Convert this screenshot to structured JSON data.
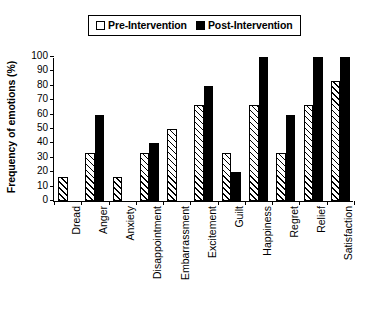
{
  "chart_data": {
    "type": "bar",
    "title": "",
    "xlabel": "",
    "ylabel": "Frequency of emotions (%)",
    "ylim": [
      0,
      100
    ],
    "yticks": [
      0,
      10,
      20,
      30,
      40,
      50,
      60,
      70,
      80,
      90,
      100
    ],
    "grid": false,
    "legend_position": "top-center",
    "categories": [
      "Dread",
      "Anger",
      "Anxiety",
      "Disappointment",
      "Embarrassment",
      "Excitement",
      "Guilt",
      "Happiness",
      "Regret",
      "Relief",
      "Satisfaction"
    ],
    "series": [
      {
        "name": "Pre-Intervention",
        "style": "hatched-white",
        "color": "#ffffff",
        "values": [
          17,
          33,
          17,
          33,
          50,
          67,
          33,
          67,
          33,
          67,
          83
        ]
      },
      {
        "name": "Post-Intervention",
        "style": "solid-black",
        "color": "#000000",
        "values": [
          null,
          60,
          null,
          40,
          null,
          80,
          20,
          100,
          60,
          100,
          100
        ]
      }
    ]
  },
  "legend": {
    "entries": [
      {
        "label": "Pre-Intervention",
        "swatch": "hollow-square"
      },
      {
        "label": "Post-Intervention",
        "swatch": "filled-square"
      }
    ]
  },
  "axes": {
    "y_title": "Frequency of emotions (%)"
  }
}
